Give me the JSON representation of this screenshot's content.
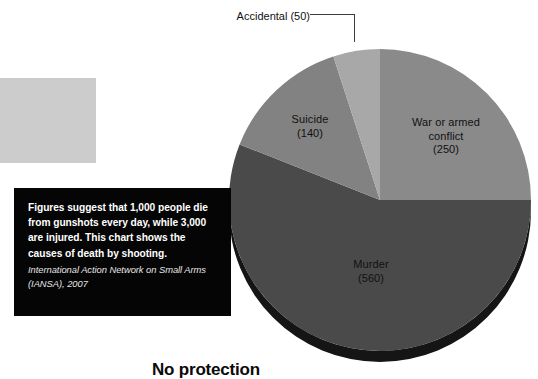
{
  "chart_data": {
    "type": "pie",
    "title": "",
    "categories": [
      "War or armed conflict",
      "Murder",
      "Suicide",
      "Accidental"
    ],
    "values": [
      250,
      560,
      140,
      50
    ],
    "total": 1000,
    "units": "deaths per day",
    "start_angle_deg": 0,
    "direction": "clockwise",
    "legend": "none",
    "labels_inside": true,
    "slice_colors": [
      "#8a8a8a",
      "#4a4a4a",
      "#828282",
      "#a8a8a8"
    ],
    "slices": [
      {
        "name": "War or armed conflict",
        "value": 250,
        "share_pct": 25.0,
        "sweep_deg": 90.0,
        "color": "#8a8a8a",
        "label_line1": "War or armed",
        "label_line2": "conflict",
        "label_line3": "(250)"
      },
      {
        "name": "Murder",
        "value": 560,
        "share_pct": 56.0,
        "sweep_deg": 201.6,
        "color": "#4a4a4a",
        "label_line1": "Murder",
        "label_line2": "(560)"
      },
      {
        "name": "Suicide",
        "value": 140,
        "share_pct": 14.0,
        "sweep_deg": 50.4,
        "color": "#828282",
        "label_line1": "Suicide",
        "label_line2": "(140)"
      },
      {
        "name": "Accidental",
        "value": 50,
        "share_pct": 5.0,
        "sweep_deg": 18.0,
        "color": "#a8a8a8",
        "label_line1": "Accidental",
        "label_line2": "(50)"
      }
    ]
  },
  "callout": {
    "accidental_label": "Accidental",
    "accidental_value": "(50)"
  },
  "slice_labels": {
    "war_line1": "War or armed",
    "war_line2": "conflict",
    "war_line3": "(250)",
    "suicide_line1": "Suicide",
    "suicide_line2": "(140)",
    "murder_line1": "Murder",
    "murder_line2": "(560)"
  },
  "caption": {
    "body": "Figures suggest that 1,000 people die from gunshots every day, while 3,000 are injured. This chart shows the causes of death by shooting.",
    "source": "International Action Network on Small Arms (IANSA), 2007",
    "background_color": "#050505",
    "text_color": "#ffffff"
  },
  "bottom_heading": {
    "text": "No protection"
  },
  "decor": {
    "gray_block_color": "#cccccc"
  }
}
